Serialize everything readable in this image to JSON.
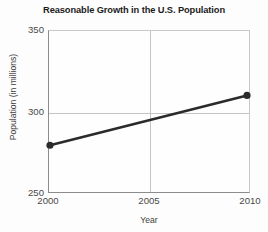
{
  "chart_data": {
    "type": "line",
    "title": "Reasonable Growth in the U.S. Population",
    "xlabel": "Year",
    "ylabel": "Population (in millions)",
    "x": [
      2000,
      2010
    ],
    "values": [
      279,
      310
    ],
    "series": [
      {
        "name": "U.S. Population",
        "x": [
          2000,
          2010
        ],
        "values": [
          279,
          310
        ]
      }
    ],
    "xlim": [
      2000,
      2010
    ],
    "ylim": [
      250,
      350
    ],
    "xticks": [
      2000,
      2005,
      2010
    ],
    "xtick_labels": [
      "2000",
      "2005",
      "2010"
    ],
    "yticks": [
      250,
      300,
      350
    ],
    "ytick_labels": [
      "250",
      "300",
      "350"
    ],
    "grid": true,
    "legend": false,
    "legend_position": "none",
    "markers": "filled-circle",
    "line_color": "#2b2b2b",
    "grid_color": "#c4c4c4",
    "axis_color": "#8c8c8c",
    "background_color": "#fdfdfd"
  }
}
